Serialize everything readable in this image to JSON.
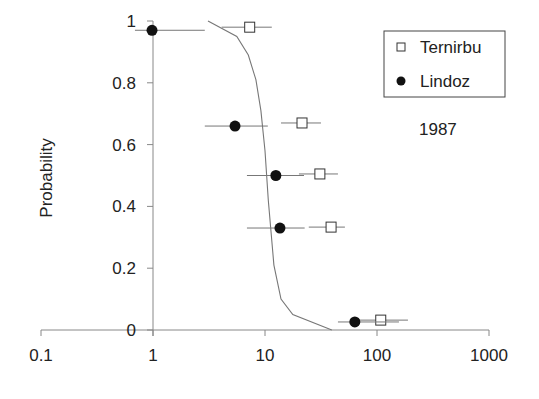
{
  "chart_data": {
    "type": "scatter",
    "title": "",
    "xlabel": "",
    "ylabel": "Probability",
    "xscale": "log",
    "xlim": [
      0.1,
      1000
    ],
    "ylim": [
      0,
      1
    ],
    "x_ticks": [
      "0.1",
      "1",
      "10",
      "100",
      "1000"
    ],
    "x_tick_values": [
      0.1,
      1,
      10,
      100,
      1000
    ],
    "y_ticks": [
      "0",
      "0.2",
      "0.4",
      "0.6",
      "0.8",
      "1"
    ],
    "y_tick_values": [
      0,
      0.2,
      0.4,
      0.6,
      0.8,
      1
    ],
    "y_axis_crosses_x_at": 1,
    "grid": false,
    "legend_position": "top-right",
    "annotation": "1987",
    "series": [
      {
        "name": "Ternirbu",
        "marker": "open-square",
        "points": [
          {
            "x": 7.3,
            "y": 0.98,
            "xerr": [
              4.1,
              11.5
            ]
          },
          {
            "x": 21.4,
            "y": 0.67,
            "xerr": [
              13.9,
              31.6
            ]
          },
          {
            "x": 30.9,
            "y": 0.505,
            "xerr": [
              20.1,
              44.8
            ]
          },
          {
            "x": 38.9,
            "y": 0.333,
            "xerr": [
              24.6,
              51.7
            ]
          },
          {
            "x": 108,
            "y": 0.032,
            "xerr": [
              63.4,
              189
            ]
          }
        ]
      },
      {
        "name": "Lindoz",
        "marker": "filled-circle",
        "points": [
          {
            "x": 0.98,
            "y": 0.97,
            "xerr": [
              0.69,
              2.9
            ]
          },
          {
            "x": 5.4,
            "y": 0.66,
            "xerr": [
              2.9,
              10.6
            ]
          },
          {
            "x": 12.5,
            "y": 0.5,
            "xerr": [
              6.9,
              22.3
            ]
          },
          {
            "x": 13.6,
            "y": 0.33,
            "xerr": [
              6.9,
              22.6
            ]
          },
          {
            "x": 63.4,
            "y": 0.026,
            "xerr": [
              44.8,
              157
            ]
          }
        ]
      },
      {
        "name": "fitted curve",
        "type": "line",
        "x": [
          3.1,
          5.6,
          7.1,
          8.3,
          9.2,
          10.0,
          10.7,
          12.0,
          13.9,
          17.7,
          39.5
        ],
        "y": [
          1.0,
          0.95,
          0.89,
          0.81,
          0.71,
          0.58,
          0.42,
          0.21,
          0.1,
          0.05,
          0.0
        ]
      }
    ]
  }
}
